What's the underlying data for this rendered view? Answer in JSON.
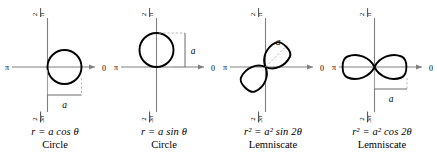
{
  "figure": {
    "background_color": "#ffffff",
    "curve_color": "#000000",
    "axis_color": "#808080",
    "bracket_color": "#a0a0a0",
    "text_color": "#000000"
  },
  "axis_labels": {
    "top": "π/2",
    "top_numerator": "π",
    "top_denominator": "2",
    "bottom_numerator": "3π",
    "bottom_denominator": "2",
    "left": "π",
    "right": "0"
  },
  "panels": [
    {
      "id": "circle-cos",
      "equation": "r = a cos θ",
      "curve_name": "Circle",
      "amplitude_label": "a",
      "curve_type": "circle",
      "orientation": "right",
      "bracket": "horizontal-below"
    },
    {
      "id": "circle-sin",
      "equation": "r = a sin θ",
      "curve_name": "Circle",
      "amplitude_label": "a",
      "curve_type": "circle",
      "orientation": "up",
      "bracket": "vertical-right"
    },
    {
      "id": "lemniscate-sin",
      "equation": "r² = a² sin 2θ",
      "curve_name": "Lemniscate",
      "amplitude_label": "a",
      "curve_type": "lemniscate",
      "orientation": "diagonal",
      "bracket": "dashed-diagonal"
    },
    {
      "id": "lemniscate-cos",
      "equation": "r² = a² cos 2θ",
      "curve_name": "Lemniscate",
      "amplitude_label": "a",
      "curve_type": "lemniscate",
      "orientation": "horizontal",
      "bracket": "horizontal-below"
    }
  ]
}
